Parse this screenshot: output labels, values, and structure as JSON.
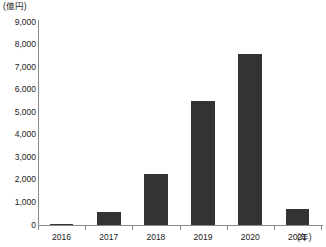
{
  "chart_data": {
    "type": "bar",
    "title": "",
    "subtitle": "",
    "xlabel": "(年)",
    "ylabel": "(億円)",
    "categories": [
      "2016",
      "2017",
      "2018",
      "2019",
      "2020",
      "2021"
    ],
    "values": [
      30,
      560,
      2250,
      5500,
      7600,
      730
    ],
    "series": [
      {
        "name": "",
        "values": [
          30,
          560,
          2250,
          5500,
          7600,
          730
        ]
      }
    ],
    "ylim": [
      0,
      9000
    ],
    "ytick_values": [
      0,
      1000,
      2000,
      3000,
      4000,
      5000,
      6000,
      7000,
      8000,
      9000
    ],
    "ytick_labels": [
      "0",
      "1,000",
      "2,000",
      "3,000",
      "4,000",
      "5,000",
      "6,000",
      "7,000",
      "8,000",
      "9,000"
    ],
    "grid": false,
    "legend": false,
    "legend_position": "none",
    "bar_color": "#333333",
    "axis_color": "#8a8a8a",
    "background_color": "#ffffff"
  },
  "axes": {
    "y_unit_label": "(億円)",
    "x_unit_label": "(年)"
  }
}
